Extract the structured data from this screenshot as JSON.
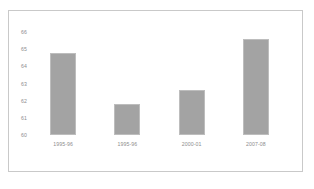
{
  "chart_data": {
    "type": "bar",
    "title": "",
    "xlabel": "",
    "ylabel": "",
    "categories": [
      "1995-96",
      "1995-96",
      "2000-01",
      "2007-08"
    ],
    "values": [
      64.8,
      61.8,
      62.6,
      65.6
    ],
    "ylim": [
      60,
      66
    ],
    "yticks": [
      66,
      65,
      64,
      63,
      62,
      61,
      60
    ],
    "ytick_labels": [
      "66",
      "65",
      "64",
      "63",
      "62",
      "61",
      "60"
    ],
    "grid": false,
    "legend": null,
    "bar_color": "#a3a3a3",
    "bar_border_color": "#bdbdbd",
    "axis_text_color": "#8d8d8d",
    "frame_border_color": "#c9c9c9",
    "background_color": "#ffffff"
  }
}
